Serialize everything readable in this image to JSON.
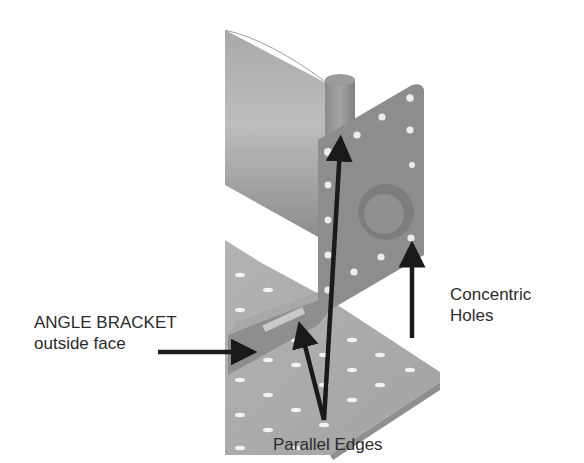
{
  "figure": {
    "colors": {
      "background": "#ffffff",
      "metal_light": "#b8b8b8",
      "metal_mid": "#9a9a9a",
      "metal_dark": "#7a7a7a",
      "bracket_face": "#8d8d8d",
      "arrow": "#1a1a1a",
      "text": "#2b2b2b"
    }
  },
  "annotations": {
    "angle_bracket": {
      "line1": "ANGLE BRACKET",
      "line2": "outside face"
    },
    "concentric_holes": {
      "line1": "Concentric",
      "line2": "Holes"
    },
    "parallel_edges": {
      "label": "Parallel Edges"
    }
  }
}
